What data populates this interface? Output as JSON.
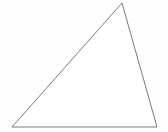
{
  "figure": {
    "shape_name": "scalene-triangle",
    "background_color": "#fefefe",
    "stroke_color": "#7a7a7a",
    "fill_color": "#ffffff",
    "stroke_width": 1,
    "canvas": {
      "width": 168,
      "height": 132
    },
    "vertices": [
      {
        "label": "apex",
        "x": 122,
        "y": 3
      },
      {
        "label": "bottom-right",
        "x": 157,
        "y": 127
      },
      {
        "label": "bottom-left",
        "x": 12,
        "y": 127
      }
    ],
    "points_path": "122,3 157,127 12,127",
    "edges": [
      {
        "name": "left-edge",
        "from": "bottom-left",
        "to": "apex"
      },
      {
        "name": "right-edge",
        "from": "apex",
        "to": "bottom-right"
      },
      {
        "name": "base-edge",
        "from": "bottom-left",
        "to": "bottom-right"
      }
    ],
    "labels": []
  }
}
